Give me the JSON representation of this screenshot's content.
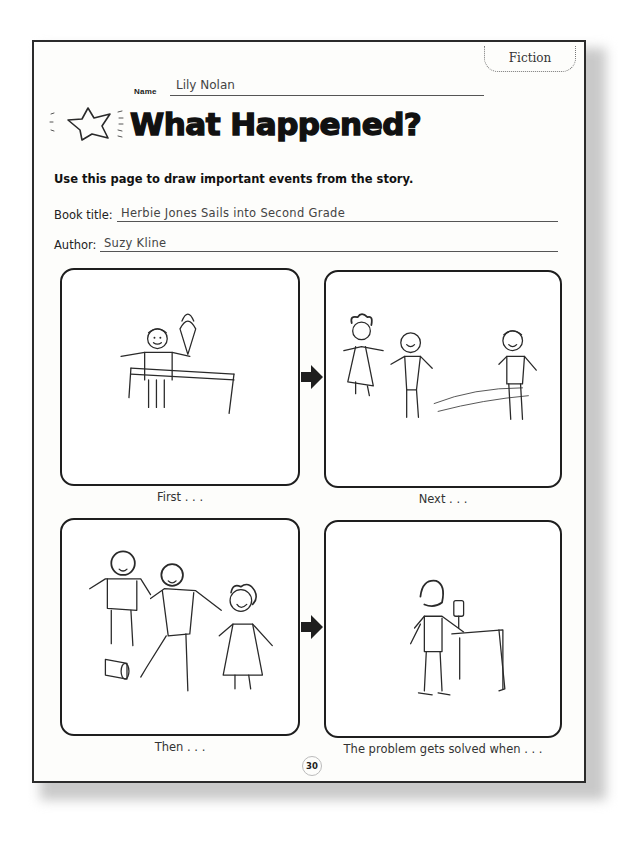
{
  "worksheet": {
    "genre_tag": "Fiction",
    "name_label": "Name",
    "name_value": "Lily Nolan",
    "title": "What Happened?",
    "instructions": "Use this page to draw important events from the story.",
    "book_title_label": "Book title:",
    "book_title_value": "Herbie Jones Sails into Second Grade",
    "author_label": "Author:",
    "author_value": "Suzy Kline",
    "page_number": "30"
  },
  "panels": [
    {
      "caption": "First . . .",
      "drawing": "child-with-ice-cream-at-table-icon"
    },
    {
      "caption": "Next . . .",
      "drawing": "three-children-standing-icon"
    },
    {
      "caption": "Then . . .",
      "drawing": "children-and-fallen-can-icon"
    },
    {
      "caption": "The problem gets solved when . . .",
      "drawing": "child-at-table-with-object-icon"
    }
  ],
  "icons": {
    "title_decoration": "star-icon",
    "sequence_arrow": "arrow-right-icon"
  },
  "colors": {
    "ink": "#1a1a1a",
    "paper": "#fdfdfb",
    "border": "#2b2b2b"
  }
}
